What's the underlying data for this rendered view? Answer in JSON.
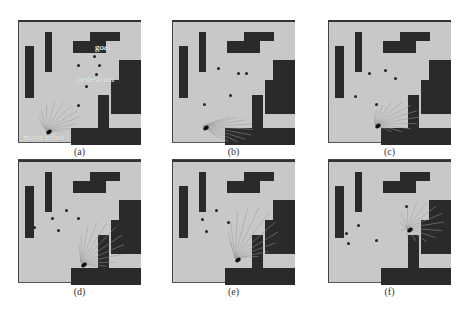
{
  "figure": {
    "panels": [
      {
        "id": "a",
        "caption": "(a)",
        "annotations": {
          "goal": "goal",
          "pedestrian": "pedestrian",
          "robot": "move robot"
        }
      },
      {
        "id": "b",
        "caption": "(b)"
      },
      {
        "id": "c",
        "caption": "(c)"
      },
      {
        "id": "d",
        "caption": "(d)"
      },
      {
        "id": "e",
        "caption": "(e)"
      },
      {
        "id": "f",
        "caption": "(f)"
      }
    ],
    "colors": {
      "floor": "#c8c8c8",
      "obstacle": "#2a2a2a",
      "tree": "#9a9a9a"
    }
  }
}
